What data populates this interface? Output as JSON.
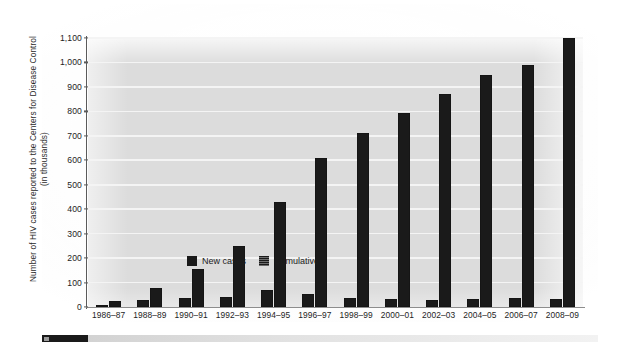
{
  "chart_data": {
    "type": "bar",
    "title": "",
    "xlabel": "",
    "ylabel": "Number of HIV cases reported to the Centers for Disease Control (in thousands)",
    "ylim": [
      0,
      1100
    ],
    "ytick_values": [
      0,
      100,
      200,
      300,
      400,
      500,
      600,
      700,
      800,
      900,
      1000,
      1100
    ],
    "ytick_labels": [
      "0",
      "100",
      "200",
      "300",
      "400",
      "500",
      "600",
      "700",
      "800",
      "900",
      "1,000",
      "1,100"
    ],
    "grid": true,
    "legend_position": "inside-upper-left",
    "categories": [
      "1986–87",
      "1988–89",
      "1990–91",
      "1992–93",
      "1994–95",
      "1996–97",
      "1998–99",
      "2000–01",
      "2002–03",
      "2004–05",
      "2006–07",
      "2008–09"
    ],
    "series": [
      {
        "name": "New cases",
        "color": "#1a1a1a",
        "values": [
          10,
          28,
          38,
          42,
          68,
          55,
          35,
          33,
          28,
          33,
          38,
          33
        ]
      },
      {
        "name": "Cumulative",
        "color": "#1a1a1a",
        "values": [
          25,
          78,
          155,
          250,
          430,
          610,
          710,
          795,
          870,
          950,
          990,
          1100
        ]
      }
    ]
  },
  "legend": {
    "items": [
      {
        "label": "New cases",
        "swatch": "solid-black-square"
      },
      {
        "label": "Cumulative",
        "swatch": "hatched-black-square"
      }
    ]
  },
  "colors": {
    "plot_background": "#dcdcdc",
    "gridline": "#f4f4f4",
    "bar": "#1a1a1a",
    "axis": "#5a5a5a",
    "text": "#1d1d1d",
    "footer_accent": "#1a1a1a"
  }
}
